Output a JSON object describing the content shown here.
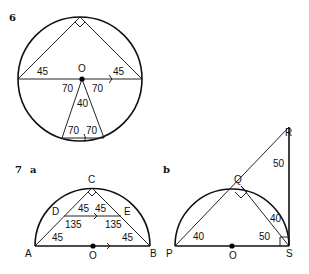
{
  "figures": [
    {
      "id": "6",
      "label": "6",
      "center_label": "O",
      "angles": {
        "left_base": "45",
        "right_base": "45",
        "center_left": "70",
        "center_right": "70",
        "apex_center": "40",
        "bottom_left": "70",
        "bottom_right": "70"
      }
    },
    {
      "id": "7a",
      "label": "7",
      "sublabel": "a",
      "points": {
        "A": "A",
        "B": "B",
        "C": "C",
        "D": "D",
        "E": "E",
        "O": "O"
      },
      "angles": {
        "d_top": "45",
        "e_top": "45",
        "d_bottom": "135",
        "e_bottom": "135",
        "a": "45",
        "b": "45"
      }
    },
    {
      "id": "7b",
      "sublabel": "b",
      "points": {
        "P": "P",
        "O": "O",
        "S": "S",
        "Q": "Q",
        "R": "R"
      },
      "angles": {
        "r": "50",
        "p": "40",
        "qs_upper": "40",
        "s_lower": "50"
      }
    }
  ]
}
